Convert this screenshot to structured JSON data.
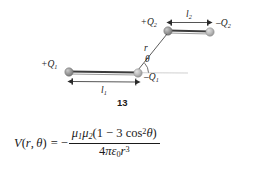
{
  "figure": {
    "number": "13",
    "caption_number_label": "13",
    "charges": [
      {
        "id": "plus-q2",
        "label": "+Q",
        "subscript": "2",
        "sign": "+",
        "x": 168,
        "y": 30,
        "color": "#8e8e8e"
      },
      {
        "id": "minus-q2",
        "label": "-Q",
        "subscript": "2",
        "sign": "-",
        "x": 210,
        "y": 31,
        "color": "#b5b5b5"
      },
      {
        "id": "plus-q1",
        "label": "+Q",
        "subscript": "1",
        "sign": "+",
        "x": 69,
        "y": 72,
        "color": "#8e8e8e"
      },
      {
        "id": "minus-q1",
        "label": "-Q",
        "subscript": "1",
        "sign": "-",
        "x": 138,
        "y": 73,
        "color": "#b5b5b5"
      }
    ],
    "lengths": [
      {
        "id": "l2",
        "label": "l",
        "subscript": "2",
        "from": "+Q2",
        "to": "-Q2"
      },
      {
        "id": "l1",
        "label": "l",
        "subscript": "1",
        "from": "+Q1",
        "to": "-Q1"
      }
    ],
    "separation_label": {
      "label": "r",
      "subscript": ""
    },
    "angle_label": {
      "label": "θ"
    },
    "colors": {
      "line": "#4a4a4a",
      "dipole_bar": "#3a3a3a",
      "axis_reference": "#c4c4c4",
      "text": "#1a1a1a",
      "sphere_light": "#b5b5b5",
      "sphere_dark": "#8e8e8e"
    }
  },
  "formula": {
    "lhs_V": "V",
    "lhs_open": "(",
    "lhs_r": "r",
    "lhs_comma": ", ",
    "lhs_theta": "θ",
    "lhs_close": ")",
    "equals": "=",
    "minus": "−",
    "numerator": {
      "mu": "μ",
      "sub1": "1",
      "sub2": "2",
      "open_paren": "(1 − 3 cos",
      "exponent": "2",
      "theta": "θ",
      "close_paren": ")"
    },
    "denominator": {
      "four": "4",
      "pi": "π",
      "epsilon": "ε",
      "epsilon_sub": "0",
      "r": "r",
      "r_exp": "3"
    },
    "plain_text": "V(r, θ) = − μ₁μ₂(1 − 3 cos²θ) / (4πε₀r³)"
  }
}
